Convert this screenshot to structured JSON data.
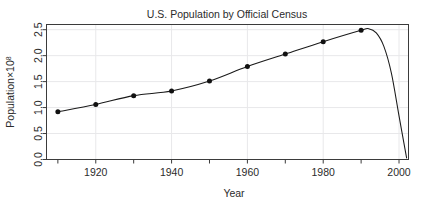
{
  "chart_data": {
    "type": "line",
    "title": "U.S. Population by Official Census",
    "xlabel": "Year",
    "ylabel": "Population×10",
    "ylabel_exponent": "8",
    "x": [
      1910,
      1920,
      1930,
      1940,
      1950,
      1960,
      1970,
      1980,
      1990
    ],
    "values": [
      0.92,
      1.06,
      1.23,
      1.32,
      1.51,
      1.79,
      2.03,
      2.27,
      2.49
    ],
    "series": [
      {
        "name": "U.S. Population",
        "values": [
          0.92,
          1.06,
          1.23,
          1.32,
          1.51,
          1.79,
          2.03,
          2.27,
          2.49
        ]
      }
    ],
    "interpolation": "spline",
    "spline_extrapolation": {
      "note": "fitted spline continues past last census point, overshoots near 1992 then falls steeply to near zero at about 2002",
      "x": [
        1990,
        1992,
        1994,
        1996,
        1998,
        2000,
        2002
      ],
      "y": [
        2.49,
        2.52,
        2.44,
        2.18,
        1.66,
        0.84,
        0.03
      ]
    },
    "xlim": [
      1907,
      2002.5
    ],
    "ylim": [
      0.0,
      2.6
    ],
    "xticks": [
      1920,
      1940,
      1960,
      1980,
      2000
    ],
    "xtick_labels": [
      "1920",
      "1940",
      "1960",
      "1980",
      "2000"
    ],
    "xminorticks": [
      1910,
      1930,
      1950,
      1970,
      1990
    ],
    "yticks": [
      0.0,
      0.5,
      1.0,
      1.5,
      2.0,
      2.5
    ],
    "ytick_labels": [
      "0.0",
      "0.5",
      "1.0",
      "1.5",
      "2.0",
      "2.5"
    ],
    "grid": true,
    "grid_color": "#e8e8ea",
    "legend": null,
    "line_color": "#1a1a1a",
    "point_color": "#111111",
    "point_symbol": "filled-circle",
    "background": "#ffffff"
  }
}
